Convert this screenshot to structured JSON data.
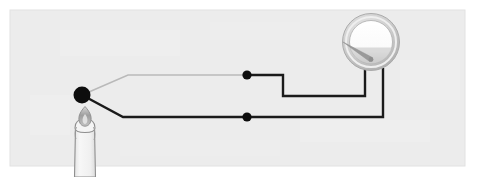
{
  "figure": {
    "title": "Thermocouple circuit with candle flame and analog meter",
    "domain_kind": "diagram",
    "canvas": {
      "width": 478,
      "height": 177,
      "background": "#ffffff"
    },
    "panel": {
      "name": "illustration-panel",
      "x": 10,
      "y": 10,
      "width": 455,
      "height": 156,
      "fill": "#ececec",
      "stroke": "#e2e2e2"
    }
  },
  "colors": {
    "page_background": "#ffffff",
    "panel_background": "#ececec",
    "wire_dark": "#1a1a1a",
    "wire_light": "#b9b9b9",
    "junction_dot": "#0d0d0d",
    "node_dot": "#0d0d0d",
    "meter_bezel_outer": "#b5b5b5",
    "meter_bezel_inner": "#d6d6d6",
    "meter_face": "#fbfbfb",
    "meter_face_shadow": "#c9c9c9",
    "meter_needle": "#9a9a9a",
    "candle_body": "#f2f2f2",
    "candle_outline": "#8e8e8e",
    "candle_flame": "#a8a8a8",
    "candle_wick": "#6f6f6f"
  },
  "components": {
    "candle": {
      "label": "candle",
      "flame_label": "flame",
      "wick_label": "wick",
      "x": 85,
      "flame_top_y": 108,
      "body_top_y": 126,
      "body_bottom_y": 177,
      "body_width": 20
    },
    "hot_junction": {
      "label": "hot-junction",
      "cx": 82,
      "cy": 95,
      "r": 8.5
    },
    "meter": {
      "label": "analog-meter",
      "cx": 371,
      "cy": 42,
      "outer_r": 29,
      "bezel_r": 25,
      "face_r": 21,
      "needle_angle_deg": -58,
      "needle_length": 19,
      "terminal_left_x": 365,
      "terminal_right_x": 383,
      "terminal_y": 68
    },
    "contacts": [
      {
        "label": "contact-upper",
        "cx": 247,
        "cy": 75,
        "r": 4.6
      },
      {
        "label": "contact-lower",
        "cx": 247,
        "cy": 117,
        "r": 4.6
      }
    ]
  },
  "wires": [
    {
      "label": "wire-upper-light-leg",
      "color": "#b9b9b9",
      "width": 1.6,
      "points": "82,95 128,75 247,75"
    },
    {
      "label": "wire-upper-dark-leg",
      "color": "#1a1a1a",
      "width": 2.4,
      "points": "247,75 283,75 283,96 365,96 365,68"
    },
    {
      "label": "wire-lower-dark-leg",
      "color": "#1a1a1a",
      "width": 2.4,
      "points": "82,95 123,117 383,117 383,68"
    }
  ]
}
